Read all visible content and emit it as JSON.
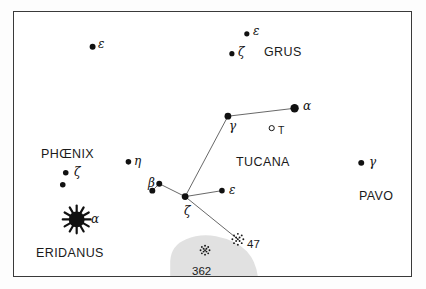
{
  "chart_data": {
    "type": "scatter",
    "xlabel": "",
    "ylabel": "",
    "xlim": [
      0,
      399
    ],
    "ylim": [
      0,
      266
    ],
    "grid": false,
    "legend": "none",
    "frame": {
      "x": 13,
      "y": 11,
      "width": 399,
      "height": 266,
      "border_color": "#3a3a3a",
      "background": "#ffffff"
    },
    "constellation_labels": [
      {
        "name": "GRUS",
        "x": 263,
        "y": 45,
        "font_size": 12.5
      },
      {
        "name": "PHŒNIX",
        "x": 40,
        "y": 147,
        "font_size": 12.5
      },
      {
        "name": "TUCANA",
        "x": 235,
        "y": 155,
        "font_size": 12.5
      },
      {
        "name": "PAVO",
        "x": 358,
        "y": 189,
        "font_size": 12.5
      },
      {
        "name": "ERIDANUS",
        "x": 35,
        "y": 246,
        "font_size": 12.5
      }
    ],
    "stars": [
      {
        "id": "grus-eps",
        "label": "ε",
        "constellation": "GRUS",
        "x": 247,
        "y": 33,
        "r": 2.6,
        "label_dx": 5,
        "label_dy": -3
      },
      {
        "id": "grus-zeta",
        "label": "ζ",
        "constellation": "GRUS",
        "x": 232,
        "y": 53,
        "r": 2.6,
        "label_dx": 5,
        "label_dy": -2
      },
      {
        "id": "phe-eps",
        "label": "ε",
        "constellation": "PHŒNIX",
        "x": 92,
        "y": 46,
        "r": 3.0,
        "label_dx": 5,
        "label_dy": -3
      },
      {
        "id": "phe-eta",
        "label": "η",
        "constellation": "PHŒNIX",
        "x": 128,
        "y": 162,
        "r": 2.8,
        "label_dx": 5,
        "label_dy": -2
      },
      {
        "id": "phe-zeta-a",
        "label": "ζ",
        "constellation": "PHŒNIX",
        "x": 65,
        "y": 173,
        "r": 2.8,
        "label_dx": 8,
        "label_dy": -2
      },
      {
        "id": "phe-zeta-b",
        "label": "",
        "constellation": "PHŒNIX",
        "x": 62,
        "y": 185,
        "r": 2.8,
        "label_dx": 0,
        "label_dy": 0
      },
      {
        "id": "tuc-alpha",
        "label": "α",
        "constellation": "TUCANA",
        "x": 295,
        "y": 108,
        "r": 4.2,
        "label_dx": 7,
        "label_dy": -3
      },
      {
        "id": "tuc-gamma",
        "label": "γ",
        "constellation": "TUCANA",
        "x": 228,
        "y": 116,
        "r": 3.4,
        "label_dx": 0,
        "label_dy": 9
      },
      {
        "id": "tuc-zeta",
        "label": "ζ",
        "constellation": "TUCANA",
        "x": 185,
        "y": 197,
        "r": 3.4,
        "label_dx": -2,
        "label_dy": 13
      },
      {
        "id": "tuc-beta-a",
        "label": "β",
        "constellation": "TUCANA",
        "x": 159,
        "y": 184,
        "r": 3.0,
        "label_dx": -12,
        "label_dy": -2
      },
      {
        "id": "tuc-beta-b",
        "label": "",
        "constellation": "TUCANA",
        "x": 152,
        "y": 191,
        "r": 3.0,
        "label_dx": 0,
        "label_dy": 0
      },
      {
        "id": "tuc-eps",
        "label": "ε",
        "constellation": "TUCANA",
        "x": 222,
        "y": 191,
        "r": 2.8,
        "label_dx": 6,
        "label_dy": -2
      },
      {
        "id": "pav-gamma",
        "label": "γ",
        "constellation": "PAVO",
        "x": 362,
        "y": 163,
        "r": 3.0,
        "label_dx": 6,
        "label_dy": -2
      }
    ],
    "bright_star": {
      "id": "eri-alpha",
      "label": "α",
      "name_note": "starburst",
      "constellation": "ERIDANUS",
      "x": 76,
      "y": 220,
      "core_r": 8,
      "spike_len": 6,
      "spikes": 12,
      "label_dx": 14,
      "label_dy": -2
    },
    "constellation_lines": [
      {
        "from": "tuc-alpha",
        "to": "tuc-gamma"
      },
      {
        "from": "tuc-gamma",
        "to": "tuc-zeta"
      },
      {
        "from": "tuc-zeta",
        "to": "tuc-beta-a"
      },
      {
        "from": "tuc-beta-a",
        "to": "tuc-beta-b"
      },
      {
        "from": "tuc-zeta",
        "to": "tuc-eps"
      },
      {
        "from": "tuc-zeta",
        "to": "cluster-47"
      }
    ],
    "deep_sky_objects": [
      {
        "id": "cluster-47",
        "label": "47",
        "type": "globular-cluster",
        "x": 238,
        "y": 240,
        "r": 5.5,
        "label_dx": 8,
        "label_dy": 4
      },
      {
        "id": "cluster-362",
        "label": "362",
        "type": "globular-cluster",
        "x": 205,
        "y": 251,
        "r": 4.5,
        "label_dx": -14,
        "label_dy": 20
      }
    ],
    "variable_stars": [
      {
        "id": "tuc-T",
        "label": "T",
        "symbol": "open-circle",
        "x": 272,
        "y": 128,
        "r": 2.6,
        "label_dx": 5,
        "label_dy": 4
      }
    ],
    "nebulosity": [
      {
        "id": "smc-cloud",
        "name": "Small Magellanic Cloud",
        "color": "#dcdcdc",
        "opacity": 0.85,
        "path": "M 170 277 L 170 262 Q 171 246 186 240 Q 200 234 216 237 Q 236 241 247 252 Q 256 262 258 277 Z"
      }
    ],
    "styles": {
      "star_fill": "#111111",
      "line_color": "#555555",
      "line_width": 0.9,
      "text_color": "#1a1a1a",
      "cluster_dot_color": "#1a1a1a"
    }
  }
}
